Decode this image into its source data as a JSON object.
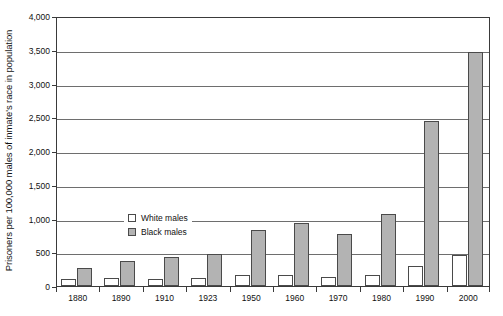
{
  "chart_data": {
    "type": "bar",
    "title": "",
    "subtitle": "",
    "xlabel": "",
    "ylabel": "Prisoners per 100,000 males of inmate's race in population",
    "ylim": [
      0,
      4000
    ],
    "ytick_step": 500,
    "grid": true,
    "legend_position": "inside-upper-left",
    "categories": [
      "1880",
      "1890",
      "1910",
      "1923",
      "1950",
      "1960",
      "1970",
      "1980",
      "1990",
      "2000"
    ],
    "ytick_labels": [
      "0",
      "500",
      "1,000",
      "1,500",
      "2,000",
      "2,500",
      "3,000",
      "3,500",
      "4,000"
    ],
    "ytick_values": [
      0,
      500,
      1000,
      1500,
      2000,
      2500,
      3000,
      3500,
      4000
    ],
    "series": [
      {
        "name": "White males",
        "swatch": "white-swatch",
        "color": "#ffffff",
        "values": [
          105,
          115,
          110,
          115,
          160,
          170,
          130,
          160,
          290,
          460
        ]
      },
      {
        "name": "Black males",
        "swatch": "black-swatch",
        "color": "#b3b3b3",
        "values": [
          270,
          370,
          430,
          470,
          830,
          940,
          770,
          1070,
          2440,
          3460
        ]
      }
    ]
  },
  "colors": {
    "bar_white": "#ffffff",
    "bar_gray": "#b3b3b3",
    "bar_outline": "#4a4a4a",
    "gridline": "#6e6e6e",
    "axis": "#3a3a3a",
    "text": "#111111",
    "background": "#ffffff"
  }
}
